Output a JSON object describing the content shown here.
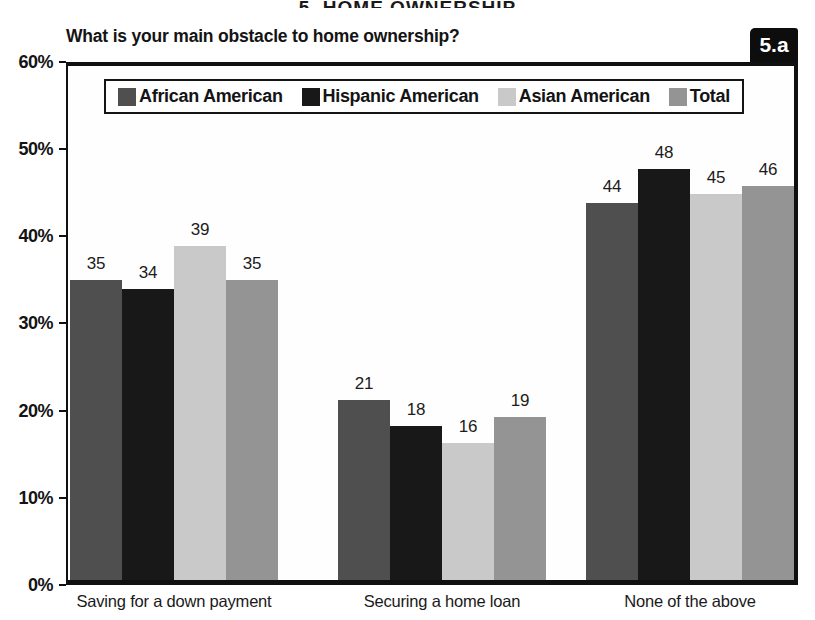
{
  "page": {
    "cropped_heading": "5. HOME OWNERSHIP",
    "figure_label": "5.a"
  },
  "colors": {
    "african_american": "#4f4f4f",
    "hispanic_american": "#181818",
    "asian_american": "#c9c9c9",
    "total": "#949494",
    "axis": "#101010",
    "badge_bg": "#0d0d0d",
    "badge_text": "#ffffff"
  },
  "chart_data": {
    "type": "bar",
    "title": "What is your main obstacle to home ownership?",
    "categories": [
      "Saving for a down payment",
      "Securing a home loan",
      "None of the above"
    ],
    "series": [
      {
        "name": "African American",
        "color": "#4f4f4f",
        "values": [
          35,
          21,
          44
        ]
      },
      {
        "name": "Hispanic American",
        "color": "#181818",
        "values": [
          34,
          18,
          48
        ]
      },
      {
        "name": "Asian American",
        "color": "#c9c9c9",
        "values": [
          39,
          16,
          45
        ]
      },
      {
        "name": "Total",
        "color": "#949494",
        "values": [
          35,
          19,
          46
        ]
      }
    ],
    "xlabel": "",
    "ylabel": "",
    "ylim": [
      0,
      60
    ],
    "ytick_step": 10,
    "ytick_labels": [
      "0%",
      "10%",
      "20%",
      "30%",
      "40%",
      "50%",
      "60%"
    ],
    "value_labels": true,
    "grid": false,
    "legend_position": "top-inside"
  }
}
